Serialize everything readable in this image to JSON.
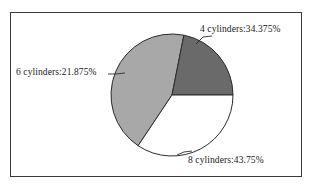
{
  "chart_data": {
    "type": "pie",
    "title": "",
    "categories": [
      "4 cylinders",
      "8 cylinders",
      "6 cylinders"
    ],
    "values": [
      34.375,
      43.75,
      21.875
    ],
    "value_unit": "%",
    "labels": [
      "4 cylinders:34.375%",
      "8 cylinders:43.75%",
      "6 cylinders:21.875%"
    ],
    "slice_colors": [
      "#ffffff",
      "#a8a8a8",
      "#6a6a6a"
    ],
    "legend": "none",
    "grid": false,
    "xlabel": "",
    "ylabel": ""
  },
  "figure": {
    "border_color": "#3a3a3a",
    "background": "#ffffff",
    "outline_color": "#2b2b2b"
  },
  "slices": [
    {
      "key": "four-cylinders",
      "category": "4 cylinders",
      "percent": 34.375,
      "label": "4 cylinders:34.375%",
      "color": "#ffffff"
    },
    {
      "key": "eight-cylinders",
      "category": "8 cylinders",
      "percent": 43.75,
      "label": "8 cylinders:43.75%",
      "color": "#a8a8a8"
    },
    {
      "key": "six-cylinders",
      "category": "6 cylinders",
      "percent": 21.875,
      "label": "6 cylinders:21.875%",
      "color": "#6a6a6a"
    }
  ]
}
